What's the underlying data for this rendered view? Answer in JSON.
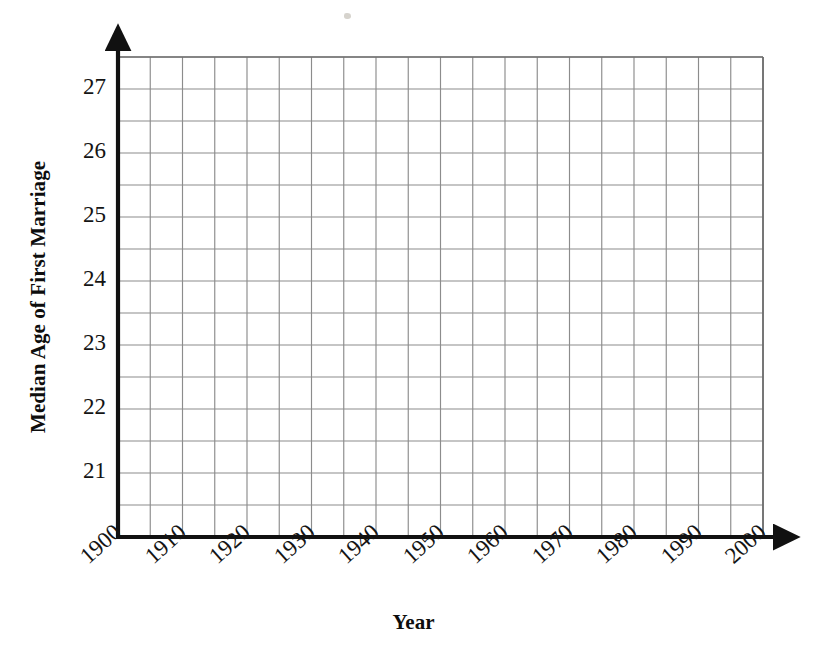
{
  "figure": {
    "kind": "blank-coordinate-grid",
    "background_color": "#ffffff",
    "ink_color": "#111111",
    "grid_color": "#8c8c8c"
  },
  "chart_data": {
    "type": "line",
    "title": "",
    "subtitle": "",
    "xlabel": "Year",
    "ylabel": "Median Age of First Marriage",
    "xlim": [
      1900,
      2000
    ],
    "ylim": [
      20.0,
      27.5
    ],
    "x_tick_labels": [
      "1900",
      "1910",
      "1920",
      "1930",
      "1940",
      "1950",
      "1960",
      "1970",
      "1980",
      "1990",
      "2000"
    ],
    "x_tick_values": [
      1900,
      1910,
      1920,
      1930,
      1940,
      1950,
      1960,
      1970,
      1980,
      1990,
      2000
    ],
    "x_tick_label_rotation_deg": -42,
    "y_tick_labels": [
      "27",
      "26",
      "25",
      "24",
      "23",
      "22",
      "21"
    ],
    "y_tick_values": [
      27,
      26,
      25,
      24,
      23,
      22,
      21
    ],
    "grid": true,
    "grid_x_step": 5,
    "grid_y_step": 0.5,
    "legend": null,
    "legend_position": "none",
    "annotations": [],
    "series": [],
    "values": [],
    "categories": [],
    "note": "Empty graph paper: axes, gridlines and labels only; no data points or curves are drawn."
  },
  "axes": {
    "x_axis_arrow": true,
    "y_axis_arrow": true
  }
}
